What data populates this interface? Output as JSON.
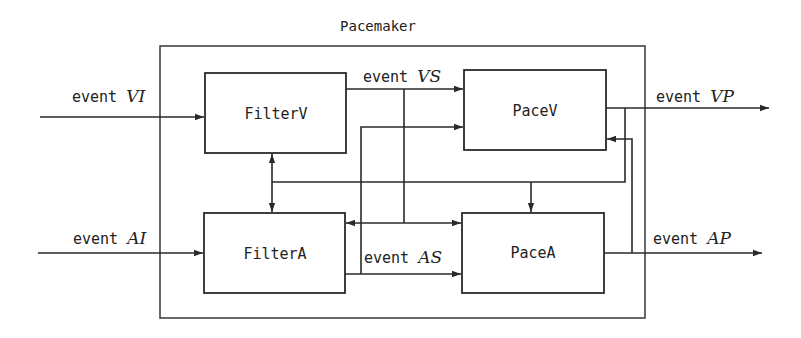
{
  "diagram": {
    "title": "Pacemaker",
    "blocks": {
      "filterV": "FilterV",
      "filterA": "FilterA",
      "paceV": "PaceV",
      "paceA": "PaceA"
    },
    "signals": {
      "vi": {
        "prefix": "event ",
        "name": "VI"
      },
      "ai": {
        "prefix": "event ",
        "name": "AI"
      },
      "vs": {
        "prefix": "event ",
        "name": "VS"
      },
      "as": {
        "prefix": "event ",
        "name": "AS"
      },
      "vp": {
        "prefix": "event ",
        "name": "VP"
      },
      "ap": {
        "prefix": "event ",
        "name": "AP"
      }
    },
    "stroke_color": "#2a2a2a"
  }
}
